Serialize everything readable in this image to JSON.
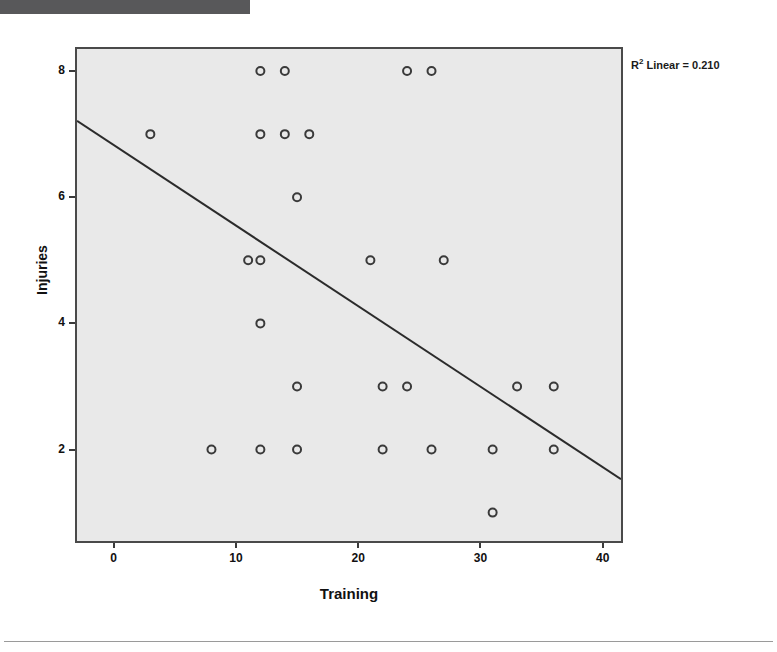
{
  "header": {
    "badge_label": "",
    "title": ""
  },
  "figure": {
    "r2_annotation_prefix": "R",
    "r2_annotation_sup": "2",
    "r2_annotation_text": " Linear = 0.210"
  },
  "chart_data": {
    "type": "scatter",
    "title": "",
    "xlabel": "Training",
    "ylabel": "Injuries",
    "xlim": [
      -3.0,
      41.5
    ],
    "ylim": [
      0.55,
      8.35
    ],
    "xticks": [
      0,
      10,
      20,
      30,
      40
    ],
    "yticks": [
      2,
      4,
      6,
      8
    ],
    "xtick_labels": [
      "0",
      "10",
      "20",
      "30",
      "40"
    ],
    "ytick_labels": [
      "2",
      "4",
      "6",
      "8"
    ],
    "grid": false,
    "legend": null,
    "marker": "open-circle",
    "marker_color": "#3a3a3a",
    "plot_background": "#e9e9e9",
    "frame_color": "#4a4a4a",
    "points": [
      {
        "x": 12,
        "y": 8
      },
      {
        "x": 14,
        "y": 8
      },
      {
        "x": 24,
        "y": 8
      },
      {
        "x": 26,
        "y": 8
      },
      {
        "x": 3,
        "y": 7
      },
      {
        "x": 12,
        "y": 7
      },
      {
        "x": 14,
        "y": 7
      },
      {
        "x": 16,
        "y": 7
      },
      {
        "x": 15,
        "y": 6
      },
      {
        "x": 11,
        "y": 5
      },
      {
        "x": 12,
        "y": 5
      },
      {
        "x": 21,
        "y": 5
      },
      {
        "x": 27,
        "y": 5
      },
      {
        "x": 12,
        "y": 4
      },
      {
        "x": 15,
        "y": 3
      },
      {
        "x": 22,
        "y": 3
      },
      {
        "x": 24,
        "y": 3
      },
      {
        "x": 33,
        "y": 3
      },
      {
        "x": 36,
        "y": 3
      },
      {
        "x": 8,
        "y": 2
      },
      {
        "x": 12,
        "y": 2
      },
      {
        "x": 15,
        "y": 2
      },
      {
        "x": 22,
        "y": 2
      },
      {
        "x": 26,
        "y": 2
      },
      {
        "x": 31,
        "y": 2
      },
      {
        "x": 36,
        "y": 2
      },
      {
        "x": 31,
        "y": 1
      }
    ],
    "fit_line": {
      "type": "linear",
      "r_squared": 0.21,
      "label": "R2 Linear = 0.210",
      "x1": -3.0,
      "y1": 7.21,
      "x2": 41.5,
      "y2": 1.53,
      "color": "#2b2b2b"
    }
  }
}
